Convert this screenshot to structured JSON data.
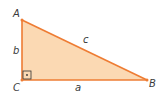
{
  "diagram": {
    "type": "right-triangle",
    "colors": {
      "fill": "#fbd9b3",
      "stroke": "#ee7c33",
      "label": "#3a3a3a",
      "right_angle_marker": "#333333"
    },
    "vertices": {
      "A": {
        "label": "A",
        "x": 22,
        "y": 20
      },
      "B": {
        "label": "B",
        "x": 147,
        "y": 80
      },
      "C": {
        "label": "C",
        "x": 22,
        "y": 80
      }
    },
    "sides": {
      "a": {
        "label": "a",
        "between": "C-B"
      },
      "b": {
        "label": "b",
        "between": "A-C"
      },
      "c": {
        "label": "c",
        "between": "A-B"
      }
    },
    "right_angle_at": "C"
  }
}
